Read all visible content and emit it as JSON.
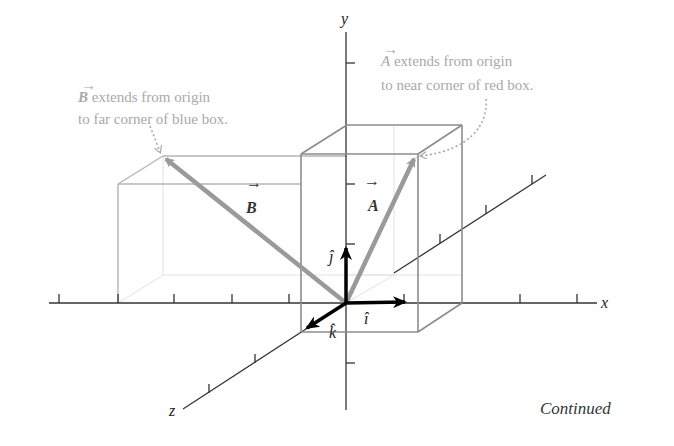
{
  "figure": {
    "axes": {
      "x": {
        "label": "x"
      },
      "y": {
        "label": "y"
      },
      "z": {
        "label": "z"
      }
    },
    "vectors": {
      "A": {
        "label": "A",
        "arrow": "→"
      },
      "B": {
        "label": "B",
        "arrow": "→"
      }
    },
    "unit_vectors": {
      "i": "î",
      "j": "ĵ",
      "k": "k̂"
    },
    "annotations": {
      "A": {
        "symbol": "A",
        "line1": " extends from origin",
        "line2": "to near corner of red box."
      },
      "B": {
        "symbol": "B",
        "line1": " extends from origin",
        "line2": "to far corner of blue box."
      }
    },
    "footer": "Continued",
    "colors": {
      "axis": "#333333",
      "box_red": "#8c8c8c",
      "box_blue": "#b4b4b4",
      "hidden_edge": "#e2e2e2",
      "vector": "#9a9a9a",
      "unit_vector": "#000000",
      "annotation": "#a9a9a9"
    }
  }
}
